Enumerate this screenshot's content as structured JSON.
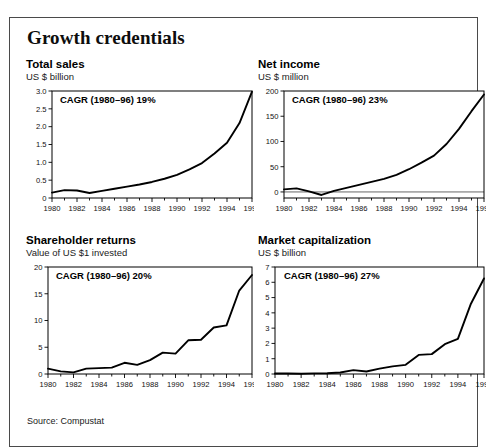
{
  "exhibit": {
    "title": "Growth credentials",
    "source": "Source: Compustat"
  },
  "panels": [
    {
      "key": "total-sales",
      "title": "Total sales",
      "unit": "US $ billion",
      "cagr": "CAGR (1980–96) 19%"
    },
    {
      "key": "net-income",
      "title": "Net income",
      "unit": "US $ million",
      "cagr": "CAGR (1980–96) 23%"
    },
    {
      "key": "shareholder-returns",
      "title": "Shareholder returns",
      "unit": "Value of US $1 invested",
      "cagr": "CAGR (1980–96) 20%"
    },
    {
      "key": "market-capitalization",
      "title": "Market capitalization",
      "unit": "US $ billion",
      "cagr": "CAGR (1980–96) 27%"
    }
  ],
  "chart_data": [
    {
      "type": "line",
      "title": "Total sales",
      "subtitle": "US $ billion",
      "annotation": "CAGR (1980–96) 19%",
      "xlabel": "",
      "ylabel": "US $ billion",
      "grid": false,
      "legend": "none",
      "xlim": [
        1980,
        1996
      ],
      "ylim": [
        0,
        3.0
      ],
      "ytick_labels": [
        "3.0",
        "2.5",
        "2.0",
        "1.5",
        "1.0",
        "0.5",
        "0"
      ],
      "yticks": [
        3.0,
        2.5,
        2.0,
        1.5,
        1.0,
        0.5,
        0
      ],
      "xtick_labels": [
        "1980",
        "1982",
        "1984",
        "1986",
        "1988",
        "1990",
        "1992",
        "1994",
        "1996"
      ],
      "xticks": [
        1980,
        1982,
        1984,
        1986,
        1988,
        1990,
        1992,
        1994,
        1996
      ],
      "x": [
        1980,
        1981,
        1982,
        1983,
        1984,
        1985,
        1986,
        1987,
        1988,
        1989,
        1990,
        1991,
        1992,
        1993,
        1994,
        1995,
        1996
      ],
      "values": [
        0.15,
        0.22,
        0.21,
        0.14,
        0.2,
        0.26,
        0.32,
        0.38,
        0.45,
        0.54,
        0.65,
        0.8,
        0.98,
        1.25,
        1.55,
        2.1,
        2.98
      ]
    },
    {
      "type": "line",
      "title": "Net income",
      "subtitle": "US $ million",
      "annotation": "CAGR (1980–96) 23%",
      "xlabel": "",
      "ylabel": "US $ million",
      "grid": false,
      "legend": "none",
      "xlim": [
        1980,
        1996
      ],
      "ylim": [
        -12,
        200
      ],
      "ytick_labels": [
        "200",
        "150",
        "100",
        "50",
        "0"
      ],
      "yticks": [
        200,
        150,
        100,
        50,
        0
      ],
      "xtick_labels": [
        "1980",
        "1982",
        "1984",
        "1986",
        "1988",
        "1990",
        "1992",
        "1994",
        "1996"
      ],
      "xticks": [
        1980,
        1982,
        1984,
        1986,
        1988,
        1990,
        1992,
        1994,
        1996
      ],
      "x": [
        1980,
        1981,
        1982,
        1983,
        1984,
        1985,
        1986,
        1987,
        1988,
        1989,
        1990,
        1991,
        1992,
        1993,
        1994,
        1995,
        1996
      ],
      "values": [
        5,
        7,
        1,
        -6,
        2,
        8,
        14,
        20,
        26,
        34,
        45,
        58,
        72,
        95,
        125,
        160,
        193
      ]
    },
    {
      "type": "line",
      "title": "Shareholder returns",
      "subtitle": "Value of US $1 invested",
      "annotation": "CAGR (1980–96) 20%",
      "xlabel": "",
      "ylabel": "Value of US $1 invested",
      "grid": false,
      "legend": "none",
      "xlim": [
        1980,
        1996
      ],
      "ylim": [
        0,
        20
      ],
      "ytick_labels": [
        "20",
        "15",
        "10",
        "5",
        "0"
      ],
      "yticks": [
        20,
        15,
        10,
        5,
        0
      ],
      "xtick_labels": [
        "1980",
        "1982",
        "1984",
        "1986",
        "1988",
        "1990",
        "1992",
        "1994",
        "1996"
      ],
      "xticks": [
        1980,
        1982,
        1984,
        1986,
        1988,
        1990,
        1992,
        1994,
        1996
      ],
      "x": [
        1980,
        1981,
        1982,
        1983,
        1984,
        1985,
        1986,
        1987,
        1988,
        1989,
        1990,
        1991,
        1992,
        1993,
        1994,
        1995,
        1996
      ],
      "values": [
        1.0,
        0.5,
        0.3,
        1.0,
        1.1,
        1.2,
        2.1,
        1.7,
        2.6,
        4.0,
        3.8,
        6.3,
        6.4,
        8.7,
        9.1,
        15.6,
        18.5
      ]
    },
    {
      "type": "line",
      "title": "Market capitalization",
      "subtitle": "US $ billion",
      "annotation": "CAGR (1980–96) 27%",
      "xlabel": "",
      "ylabel": "US $ billion",
      "grid": false,
      "legend": "none",
      "xlim": [
        1980,
        1996
      ],
      "ylim": [
        0,
        7
      ],
      "ytick_labels": [
        "7",
        "6",
        "5",
        "4",
        "3",
        "2",
        "1",
        "0"
      ],
      "yticks": [
        7,
        6,
        5,
        4,
        3,
        2,
        1,
        0
      ],
      "xtick_labels": [
        "1980",
        "1982",
        "1984",
        "1986",
        "1988",
        "1990",
        "1992",
        "1994",
        "1996"
      ],
      "xticks": [
        1980,
        1982,
        1984,
        1986,
        1988,
        1990,
        1992,
        1994,
        1996
      ],
      "x": [
        1980,
        1981,
        1982,
        1983,
        1984,
        1985,
        1986,
        1987,
        1988,
        1989,
        1990,
        1991,
        1992,
        1993,
        1994,
        1995,
        1996
      ],
      "values": [
        0.03,
        0.03,
        0.02,
        0.04,
        0.05,
        0.1,
        0.25,
        0.16,
        0.35,
        0.5,
        0.6,
        1.25,
        1.3,
        1.95,
        2.3,
        4.6,
        6.25
      ]
    }
  ]
}
